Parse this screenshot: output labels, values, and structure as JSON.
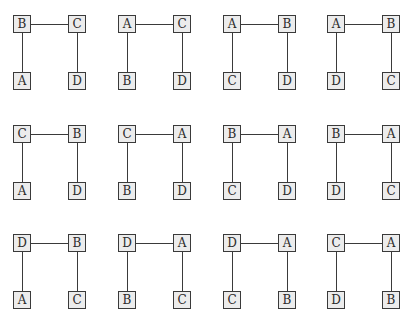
{
  "figure": {
    "rows": 3,
    "columns": 4,
    "colors": {
      "node_fill": "#ececec",
      "node_border": "#3a3a3a",
      "edge": "#3a3a3a",
      "background": "#ffffff"
    }
  },
  "diagrams": [
    {
      "top_left": "B",
      "top_right": "C",
      "bottom_left": "A",
      "bottom_right": "D"
    },
    {
      "top_left": "A",
      "top_right": "C",
      "bottom_left": "B",
      "bottom_right": "D"
    },
    {
      "top_left": "A",
      "top_right": "B",
      "bottom_left": "C",
      "bottom_right": "D"
    },
    {
      "top_left": "A",
      "top_right": "B",
      "bottom_left": "D",
      "bottom_right": "C"
    },
    {
      "top_left": "C",
      "top_right": "B",
      "bottom_left": "A",
      "bottom_right": "D"
    },
    {
      "top_left": "C",
      "top_right": "A",
      "bottom_left": "B",
      "bottom_right": "D"
    },
    {
      "top_left": "B",
      "top_right": "A",
      "bottom_left": "C",
      "bottom_right": "D"
    },
    {
      "top_left": "B",
      "top_right": "A",
      "bottom_left": "D",
      "bottom_right": "C"
    },
    {
      "top_left": "D",
      "top_right": "B",
      "bottom_left": "A",
      "bottom_right": "C"
    },
    {
      "top_left": "D",
      "top_right": "A",
      "bottom_left": "B",
      "bottom_right": "C"
    },
    {
      "top_left": "D",
      "top_right": "A",
      "bottom_left": "C",
      "bottom_right": "B"
    },
    {
      "top_left": "C",
      "top_right": "A",
      "bottom_left": "D",
      "bottom_right": "B"
    }
  ]
}
